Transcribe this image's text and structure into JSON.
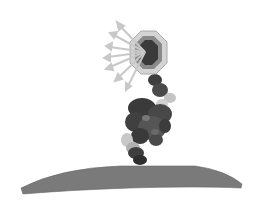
{
  "figure": {
    "field_label": "B",
    "colors": {
      "background": "#ffffff",
      "field_arrow_fill": "#ececec",
      "field_arrow_stroke": "#9a9a9a",
      "octagon_outer": "#d4d4d4",
      "octagon_mid": "#8a8a8a",
      "octagon_inner": "#3a3a3a",
      "emission_arrows": "#c8c8c8",
      "dipole_arrow": "#2a2a2a",
      "molecule_dark": "#3e3e3e",
      "molecule_mid": "#5e5e5e",
      "molecule_light": "#bdbdbd",
      "surface": "#7a7a7a"
    }
  }
}
